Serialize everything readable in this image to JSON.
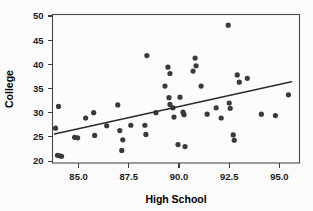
{
  "chart_data": {
    "type": "scatter",
    "title": "",
    "xlabel": "High School",
    "ylabel": "College",
    "xlim": [
      83.7,
      96.0
    ],
    "ylim": [
      19.6,
      50.3
    ],
    "xticks": [
      85.0,
      87.5,
      90.0,
      92.5,
      95.0
    ],
    "xtick_labels": [
      "85.0",
      "87.5",
      "90.0",
      "92.5",
      "95.0"
    ],
    "yticks": [
      20,
      25,
      30,
      35,
      40,
      45,
      50
    ],
    "ytick_labels": [
      "20",
      "25",
      "30",
      "35",
      "40",
      "45",
      "50"
    ],
    "grid": false,
    "legend": null,
    "marker_color": "#3a3a3a",
    "marker_size": 2.6,
    "plot_background": "#fcfcfc",
    "figure_background": "#fbfbfb",
    "frame_color": "#4a4a4a",
    "points": [
      [
        83.85,
        26.8
      ],
      [
        84.0,
        31.3
      ],
      [
        83.95,
        21.2
      ],
      [
        84.05,
        21.1
      ],
      [
        84.15,
        21.0
      ],
      [
        84.8,
        24.9
      ],
      [
        84.95,
        24.8
      ],
      [
        85.35,
        28.9
      ],
      [
        85.75,
        30.0
      ],
      [
        85.8,
        25.3
      ],
      [
        86.4,
        27.3
      ],
      [
        86.95,
        31.6
      ],
      [
        87.05,
        26.3
      ],
      [
        87.2,
        24.4
      ],
      [
        87.15,
        22.2
      ],
      [
        87.6,
        27.4
      ],
      [
        88.3,
        27.4
      ],
      [
        88.4,
        41.8
      ],
      [
        88.35,
        25.5
      ],
      [
        88.85,
        30.0
      ],
      [
        89.3,
        35.5
      ],
      [
        89.45,
        39.4
      ],
      [
        89.55,
        38.1
      ],
      [
        89.5,
        33.1
      ],
      [
        89.55,
        31.7
      ],
      [
        89.7,
        31.0
      ],
      [
        89.75,
        29.1
      ],
      [
        89.95,
        23.4
      ],
      [
        90.05,
        33.2
      ],
      [
        90.2,
        30.1
      ],
      [
        90.25,
        29.6
      ],
      [
        90.3,
        23.0
      ],
      [
        90.8,
        41.3
      ],
      [
        90.85,
        39.7
      ],
      [
        90.7,
        38.6
      ],
      [
        91.1,
        35.5
      ],
      [
        91.4,
        29.7
      ],
      [
        91.85,
        31.0
      ],
      [
        92.1,
        28.9
      ],
      [
        92.45,
        48.1
      ],
      [
        92.5,
        32.0
      ],
      [
        92.55,
        30.9
      ],
      [
        92.7,
        25.4
      ],
      [
        92.75,
        24.3
      ],
      [
        92.9,
        37.8
      ],
      [
        93.0,
        36.3
      ],
      [
        93.4,
        37.1
      ],
      [
        94.1,
        29.7
      ],
      [
        94.8,
        29.4
      ],
      [
        95.45,
        33.7
      ]
    ],
    "fit_line": {
      "type": "linear-regression",
      "x_start": 83.8,
      "y_start": 25.6,
      "x_end": 95.6,
      "y_end": 36.4,
      "color": "#2b2b2b"
    }
  }
}
